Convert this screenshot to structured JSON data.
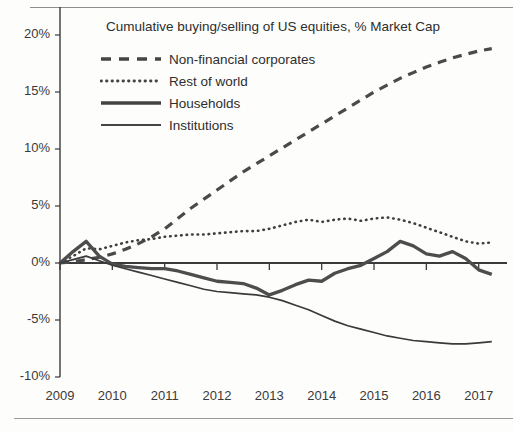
{
  "chart_data": {
    "type": "line",
    "title": "Cumulative buying/selling of US equities, % Market Cap",
    "xlabel": "",
    "ylabel": "",
    "grid": false,
    "legend_position": "top-left-inside",
    "xlim": [
      2009,
      2017.35
    ],
    "ylim": [
      -10,
      20
    ],
    "ytick_labels": [
      "20%",
      "15%",
      "10%",
      "5%",
      "0%",
      "-5%",
      "-10%"
    ],
    "ytick_values": [
      20,
      15,
      10,
      5,
      0,
      -5,
      -10
    ],
    "xtick_labels": [
      "2009",
      "2010",
      "2011",
      "2012",
      "2013",
      "2014",
      "2015",
      "2016",
      "2017"
    ],
    "xtick_values": [
      2009,
      2010,
      2011,
      2012,
      2013,
      2014,
      2015,
      2016,
      2017
    ],
    "x": [
      2009.0,
      2009.25,
      2009.5,
      2009.75,
      2010.0,
      2010.25,
      2010.5,
      2010.75,
      2011.0,
      2011.25,
      2011.5,
      2011.75,
      2012.0,
      2012.25,
      2012.5,
      2012.75,
      2013.0,
      2013.25,
      2013.5,
      2013.75,
      2014.0,
      2014.25,
      2014.5,
      2014.75,
      2015.0,
      2015.25,
      2015.5,
      2015.75,
      2016.0,
      2016.25,
      2016.5,
      2016.75,
      2017.0,
      2017.25
    ],
    "series": [
      {
        "name": "Non-financial corporates",
        "style": "dashed",
        "color": "#4a4a4a",
        "width": 3.2,
        "values": [
          0.0,
          0.1,
          0.3,
          0.5,
          0.8,
          1.2,
          1.7,
          2.3,
          3.0,
          3.9,
          4.8,
          5.6,
          6.4,
          7.2,
          8.0,
          8.7,
          9.4,
          10.1,
          10.8,
          11.5,
          12.2,
          12.9,
          13.6,
          14.3,
          15.0,
          15.6,
          16.2,
          16.7,
          17.2,
          17.6,
          18.0,
          18.3,
          18.6,
          18.8
        ]
      },
      {
        "name": "Rest of world",
        "style": "dotted",
        "color": "#3f3f3f",
        "width": 2.6,
        "values": [
          0.0,
          0.6,
          1.3,
          1.2,
          1.5,
          1.8,
          2.0,
          2.1,
          2.3,
          2.4,
          2.5,
          2.5,
          2.6,
          2.7,
          2.8,
          2.8,
          3.0,
          3.3,
          3.6,
          3.8,
          3.6,
          3.8,
          3.9,
          3.7,
          3.9,
          4.0,
          3.8,
          3.5,
          3.1,
          2.7,
          2.3,
          1.9,
          1.7,
          1.8
        ]
      },
      {
        "name": "Households",
        "style": "solid-thick",
        "color": "#4d4d4d",
        "width": 3.3,
        "values": [
          0.0,
          1.0,
          1.9,
          0.6,
          -0.1,
          -0.3,
          -0.4,
          -0.5,
          -0.5,
          -0.7,
          -1.0,
          -1.3,
          -1.6,
          -1.7,
          -1.8,
          -2.2,
          -2.8,
          -2.4,
          -1.9,
          -1.5,
          -1.6,
          -0.9,
          -0.5,
          -0.2,
          0.4,
          1.0,
          1.9,
          1.5,
          0.8,
          0.6,
          1.0,
          0.4,
          -0.6,
          -1.0
        ]
      },
      {
        "name": "Institutions",
        "style": "solid-thin",
        "color": "#3a3a3a",
        "width": 1.7,
        "values": [
          0.0,
          0.3,
          0.6,
          0.2,
          -0.2,
          -0.5,
          -0.8,
          -1.1,
          -1.4,
          -1.7,
          -2.0,
          -2.3,
          -2.5,
          -2.6,
          -2.7,
          -2.8,
          -3.0,
          -3.3,
          -3.7,
          -4.1,
          -4.6,
          -5.1,
          -5.5,
          -5.8,
          -6.1,
          -6.4,
          -6.6,
          -6.8,
          -6.9,
          -7.0,
          -7.1,
          -7.1,
          -7.0,
          -6.9
        ]
      }
    ]
  },
  "legend": {
    "items": [
      {
        "label": "Non-financial corporates",
        "style": "dashed"
      },
      {
        "label": "Rest of world",
        "style": "dotted"
      },
      {
        "label": "Households",
        "style": "solid-thick"
      },
      {
        "label": "Institutions",
        "style": "solid-thin"
      }
    ]
  },
  "colors": {
    "line": "#4a4a4a",
    "axis": "#3a3a3a",
    "text": "#2e2e2e",
    "background": "#fdfdfc"
  }
}
